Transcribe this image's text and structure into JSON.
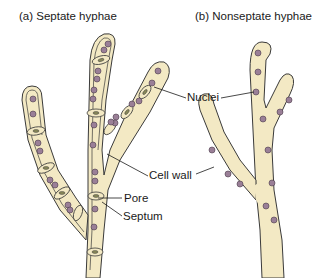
{
  "panels": {
    "a": {
      "title": "(a)  Septate hyphae"
    },
    "b": {
      "title": "(b)  Nonseptate hyphae"
    }
  },
  "labels": {
    "nuclei": "Nuclei",
    "cell_wall": "Cell wall",
    "pore": "Pore",
    "septum": "Septum"
  },
  "colors": {
    "cytoplasm": "#f3e9c4",
    "nucleus": "#9a7f97",
    "outline": "#3a3a3a"
  }
}
